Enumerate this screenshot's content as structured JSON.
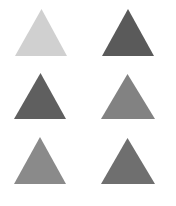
{
  "canvas": {
    "width": 176,
    "height": 206,
    "background": "#ffffff"
  },
  "triangles": [
    {
      "id": "top-left",
      "color": "#d0d0d0",
      "apex": [
        41.5,
        9
      ],
      "base_left": [
        15,
        56
      ],
      "base_right": [
        67,
        56
      ]
    },
    {
      "id": "top-right",
      "color": "#5a5a5a",
      "apex": [
        128,
        9
      ],
      "base_left": [
        102,
        56
      ],
      "base_right": [
        154,
        56
      ]
    },
    {
      "id": "middle-left",
      "color": "#5f5f5f",
      "apex": [
        40.5,
        73
      ],
      "base_left": [
        14,
        119
      ],
      "base_right": [
        66,
        119
      ]
    },
    {
      "id": "middle-right",
      "color": "#828282",
      "apex": [
        127.5,
        74
      ],
      "base_left": [
        101,
        119
      ],
      "base_right": [
        155,
        119
      ]
    },
    {
      "id": "bottom-left",
      "color": "#8a8a8a",
      "apex": [
        40,
        137
      ],
      "base_left": [
        14,
        184
      ],
      "base_right": [
        66,
        184
      ]
    },
    {
      "id": "bottom-right",
      "color": "#6f6f6f",
      "apex": [
        127.5,
        138
      ],
      "base_left": [
        101,
        184
      ],
      "base_right": [
        155,
        184
      ]
    }
  ]
}
